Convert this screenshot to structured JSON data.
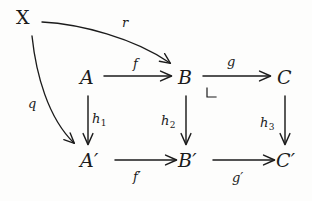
{
  "figure": {
    "kind": "commutative-diagram",
    "title": "",
    "background_color": "#fdfdfc",
    "ink_color": "#1b1b1b"
  },
  "nodes": [
    {
      "id": "X",
      "label": "X",
      "x": 25,
      "y": 20,
      "style": "upright"
    },
    {
      "id": "A",
      "label": "A",
      "x": 88,
      "y": 80,
      "style": "italic"
    },
    {
      "id": "B",
      "label": "B",
      "x": 185,
      "y": 80,
      "style": "italic"
    },
    {
      "id": "C",
      "label": "C",
      "x": 285,
      "y": 80,
      "style": "italic"
    },
    {
      "id": "Aprime",
      "label": "A′",
      "x": 92,
      "y": 163,
      "style": "italic"
    },
    {
      "id": "Bprime",
      "label": "B′",
      "x": 190,
      "y": 163,
      "style": "italic"
    },
    {
      "id": "Cprime",
      "label": "C′",
      "x": 288,
      "y": 163,
      "style": "italic"
    }
  ],
  "edges": [
    {
      "id": "r",
      "from": "X",
      "to": "B",
      "label": "r",
      "subscript": "",
      "shape": "curve",
      "label_x": 122,
      "label_y": 22
    },
    {
      "id": "q",
      "from": "X",
      "to": "Aprime",
      "label": "q",
      "subscript": "",
      "shape": "curve",
      "label_x": 28,
      "label_y": 103
    },
    {
      "id": "f",
      "from": "A",
      "to": "B",
      "label": "f",
      "subscript": "",
      "shape": "straight",
      "label_x": 133,
      "label_y": 65
    },
    {
      "id": "g",
      "from": "B",
      "to": "C",
      "label": "g",
      "subscript": "",
      "shape": "straight",
      "label_x": 227,
      "label_y": 63
    },
    {
      "id": "h1",
      "from": "A",
      "to": "Aprime",
      "label": "h",
      "subscript": "1",
      "shape": "straight",
      "label_x": 93,
      "label_y": 118
    },
    {
      "id": "h2",
      "from": "B",
      "to": "Bprime",
      "label": "h",
      "subscript": "2",
      "shape": "straight",
      "label_x": 163,
      "label_y": 120
    },
    {
      "id": "h3",
      "from": "C",
      "to": "Cprime",
      "label": "h",
      "subscript": "3",
      "shape": "straight",
      "label_x": 262,
      "label_y": 122
    },
    {
      "id": "fprime",
      "from": "Aprime",
      "to": "Bprime",
      "label": "f′",
      "subscript": "",
      "shape": "straight",
      "label_x": 134,
      "label_y": 177
    },
    {
      "id": "gprime",
      "from": "Bprime",
      "to": "Cprime",
      "label": "g′",
      "subscript": "",
      "shape": "straight",
      "label_x": 233,
      "label_y": 178
    }
  ],
  "markers": [
    {
      "id": "pullback-corner",
      "kind": "corner-marker",
      "glyph": "⌟",
      "at_node": "B",
      "x": 207,
      "y": 95
    }
  ]
}
